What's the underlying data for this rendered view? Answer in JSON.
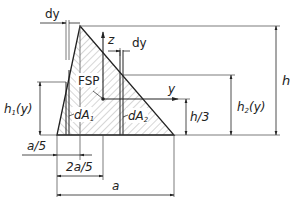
{
  "diagram": {
    "type": "triangle-cross-section",
    "labels": {
      "dy_top": "dy",
      "dy_right": "dy",
      "z_axis": "z",
      "y_axis": "y",
      "centroid": "FSP",
      "dA1": "dA",
      "dA1_sub": "1",
      "dA2": "dA",
      "dA2_sub": "2",
      "h": "h",
      "h1y": "h",
      "h1y_sub": "1",
      "h1y_arg": "(y)",
      "h2y": "h",
      "h2y_sub": "2",
      "h2y_arg": "(y)",
      "h_third": "h/3",
      "a_fifth": "a/5",
      "two_a_fifth": "2a/5",
      "a": "a"
    },
    "colors": {
      "line": "#222222",
      "hatch": "#777777",
      "background": "#ffffff"
    }
  }
}
